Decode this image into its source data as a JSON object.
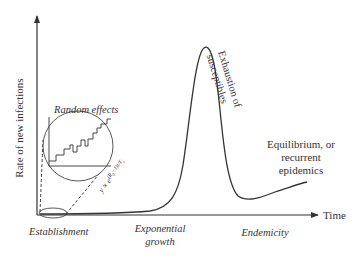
{
  "diagram": {
    "y_axis_label": "Rate of new infections",
    "x_axis_label": "Time",
    "annotations": {
      "random_effects": "Random effects",
      "exhaustion_line1": "Exhaustion of",
      "exhaustion_line2": "susceptibles",
      "equilibrium_line1": "Equilibrium, or",
      "equilibrium_line2": "recurrent",
      "equilibrium_line3": "epidemics",
      "formula": "y ∝ e^{(R₀−1)t/T_s}"
    },
    "phases": {
      "establishment": "Establishment",
      "exponential_line1": "Exponential",
      "exponential_line2": "growth",
      "endemicity": "Endemicity"
    },
    "colors": {
      "line": "#333333",
      "text": "#333333",
      "background": "#ffffff"
    }
  }
}
